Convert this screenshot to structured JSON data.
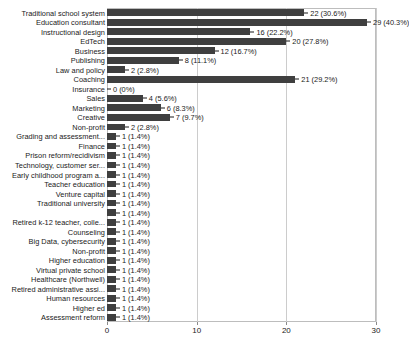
{
  "chart_data": {
    "type": "bar",
    "orientation": "horizontal",
    "title": "",
    "subtitle": "",
    "xlabel": "",
    "ylabel": "",
    "xlim": [
      0,
      30
    ],
    "xticks": [
      0,
      10,
      20,
      30
    ],
    "xtick_labels": [
      "0",
      "10",
      "20",
      "30"
    ],
    "grid": true,
    "legend": false,
    "total_responses": 72,
    "bar_color": "#3f3f3f",
    "gridline_color": "#cccccc",
    "frame_color": "#bdbdbd",
    "categories": [
      "Traditional school system",
      "Education consultant",
      "Instructional design",
      "EdTech",
      "Business",
      "Publishing",
      "Law and policy",
      "Coaching",
      "Insurance",
      "Sales",
      "Marketing",
      "Creative",
      "Non-profit",
      "Grading and assessment...",
      "Finance",
      "Prison reform/recidivism",
      "Technology, customer ser...",
      "Early childhood program a...",
      "Teacher education",
      "Venture capital",
      "Traditional university",
      "",
      "Retired k-12 teacher, colle...",
      "Counseling",
      "Big Data, cybersecurity",
      "Non-profit",
      "Higher education",
      "Virtual private school",
      "Healthcare (Northwell)",
      "Retired administrative assi...",
      "Human resources",
      "Higher ed",
      "Assessment reform"
    ],
    "values": [
      22,
      29,
      16,
      20,
      12,
      8,
      2,
      21,
      0,
      4,
      6,
      7,
      2,
      1,
      1,
      1,
      1,
      1,
      1,
      1,
      1,
      1,
      1,
      1,
      1,
      1,
      1,
      1,
      1,
      1,
      1,
      1,
      1
    ],
    "percentages": [
      "30.6%",
      "40.3%",
      "22.2%",
      "27.8%",
      "16.7%",
      "11.1%",
      "2.8%",
      "29.2%",
      "0%",
      "5.6%",
      "8.3%",
      "9.7%",
      "2.8%",
      "1.4%",
      "1.4%",
      "1.4%",
      "1.4%",
      "1.4%",
      "1.4%",
      "1.4%",
      "1.4%",
      "1.4%",
      "1.4%",
      "1.4%",
      "1.4%",
      "1.4%",
      "1.4%",
      "1.4%",
      "1.4%",
      "1.4%",
      "1.4%",
      "1.4%",
      "1.4%"
    ],
    "data_labels": [
      "22 (30.6%)",
      "29 (40.3%)",
      "16 (22.2%)",
      "20 (27.8%)",
      "12 (16.7%)",
      "8 (11.1%)",
      "2 (2.8%)",
      "21 (29.2%)",
      "0 (0%)",
      "4 (5.6%)",
      "6 (8.3%)",
      "7 (9.7%)",
      "2 (2.8%)",
      "1 (1.4%)",
      "1 (1.4%)",
      "1 (1.4%)",
      "1 (1.4%)",
      "1 (1.4%)",
      "1 (1.4%)",
      "1 (1.4%)",
      "1 (1.4%)",
      "1 (1.4%)",
      "1 (1.4%)",
      "1 (1.4%)",
      "1 (1.4%)",
      "1 (1.4%)",
      "1 (1.4%)",
      "1 (1.4%)",
      "1 (1.4%)",
      "1 (1.4%)",
      "1 (1.4%)",
      "1 (1.4%)",
      "1 (1.4%)"
    ]
  }
}
